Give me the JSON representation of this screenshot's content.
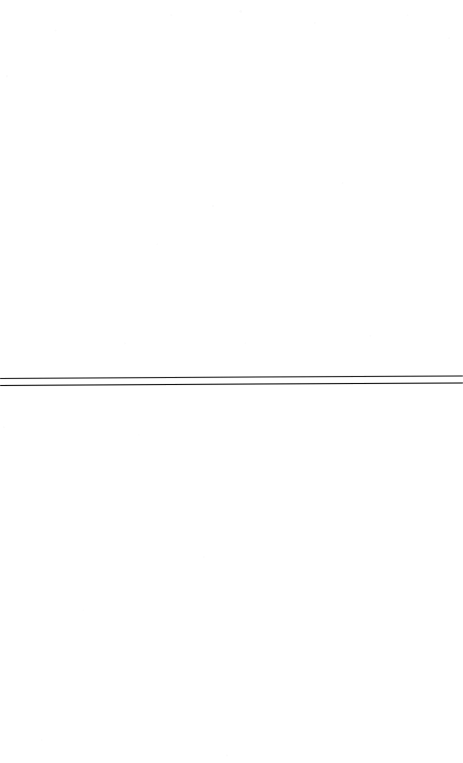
{
  "page": {
    "label": "Scanned document page",
    "width": 463,
    "height": 763,
    "background_color": "#ffffff",
    "content_summary": "Blank white scanned page with a pair of thin horizontal ruled lines across the middle",
    "visible_text": ""
  },
  "paper": {
    "name": "paper-grain",
    "description": "Faint near-white scanner speckle across the sheet",
    "tone_color": "#ffffff",
    "speckle_color": "#78788 2"
  },
  "ruled_lines": {
    "label": "Horizontal ruled line pair",
    "count": 2,
    "stroke_color": "#1a1a1a",
    "halo_color": "#8a8a8a",
    "skew_degrees": -0.32,
    "group_top": 372,
    "lines": [
      {
        "name": "upper-rule-line",
        "offset_top": 5.5,
        "thickness": 1.6,
        "color": "#1a1a1a",
        "opacity": 0.94
      },
      {
        "name": "lower-rule-line",
        "offset_top": 12.5,
        "thickness": 1.8,
        "color": "#141414",
        "opacity": 1
      }
    ]
  }
}
